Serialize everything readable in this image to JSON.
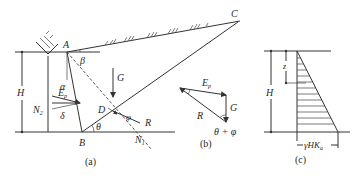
{
  "figure_a": {
    "caption": "(a)",
    "points": {
      "A": "A",
      "B": "B",
      "C": "C",
      "D": "D"
    },
    "labels": {
      "height": "H",
      "beta": "β",
      "alpha": "α",
      "weight": "G",
      "earth_pressure": "E",
      "earth_pressure_sub": "p",
      "delta": "δ",
      "wall_normal": "N",
      "wall_normal_sub": "2",
      "slip_normal": "N",
      "slip_normal_sub": "1",
      "reaction": "R",
      "theta": "θ",
      "phi": "φ"
    }
  },
  "figure_b": {
    "caption": "(b)",
    "labels": {
      "earth_pressure": "E",
      "earth_pressure_sub": "p",
      "weight": "G",
      "reaction": "R",
      "angle": "θ + φ"
    }
  },
  "figure_c": {
    "caption": "(c)",
    "labels": {
      "height": "H",
      "depth": "z",
      "base_pressure": "γHK",
      "base_pressure_sub": "a"
    }
  }
}
